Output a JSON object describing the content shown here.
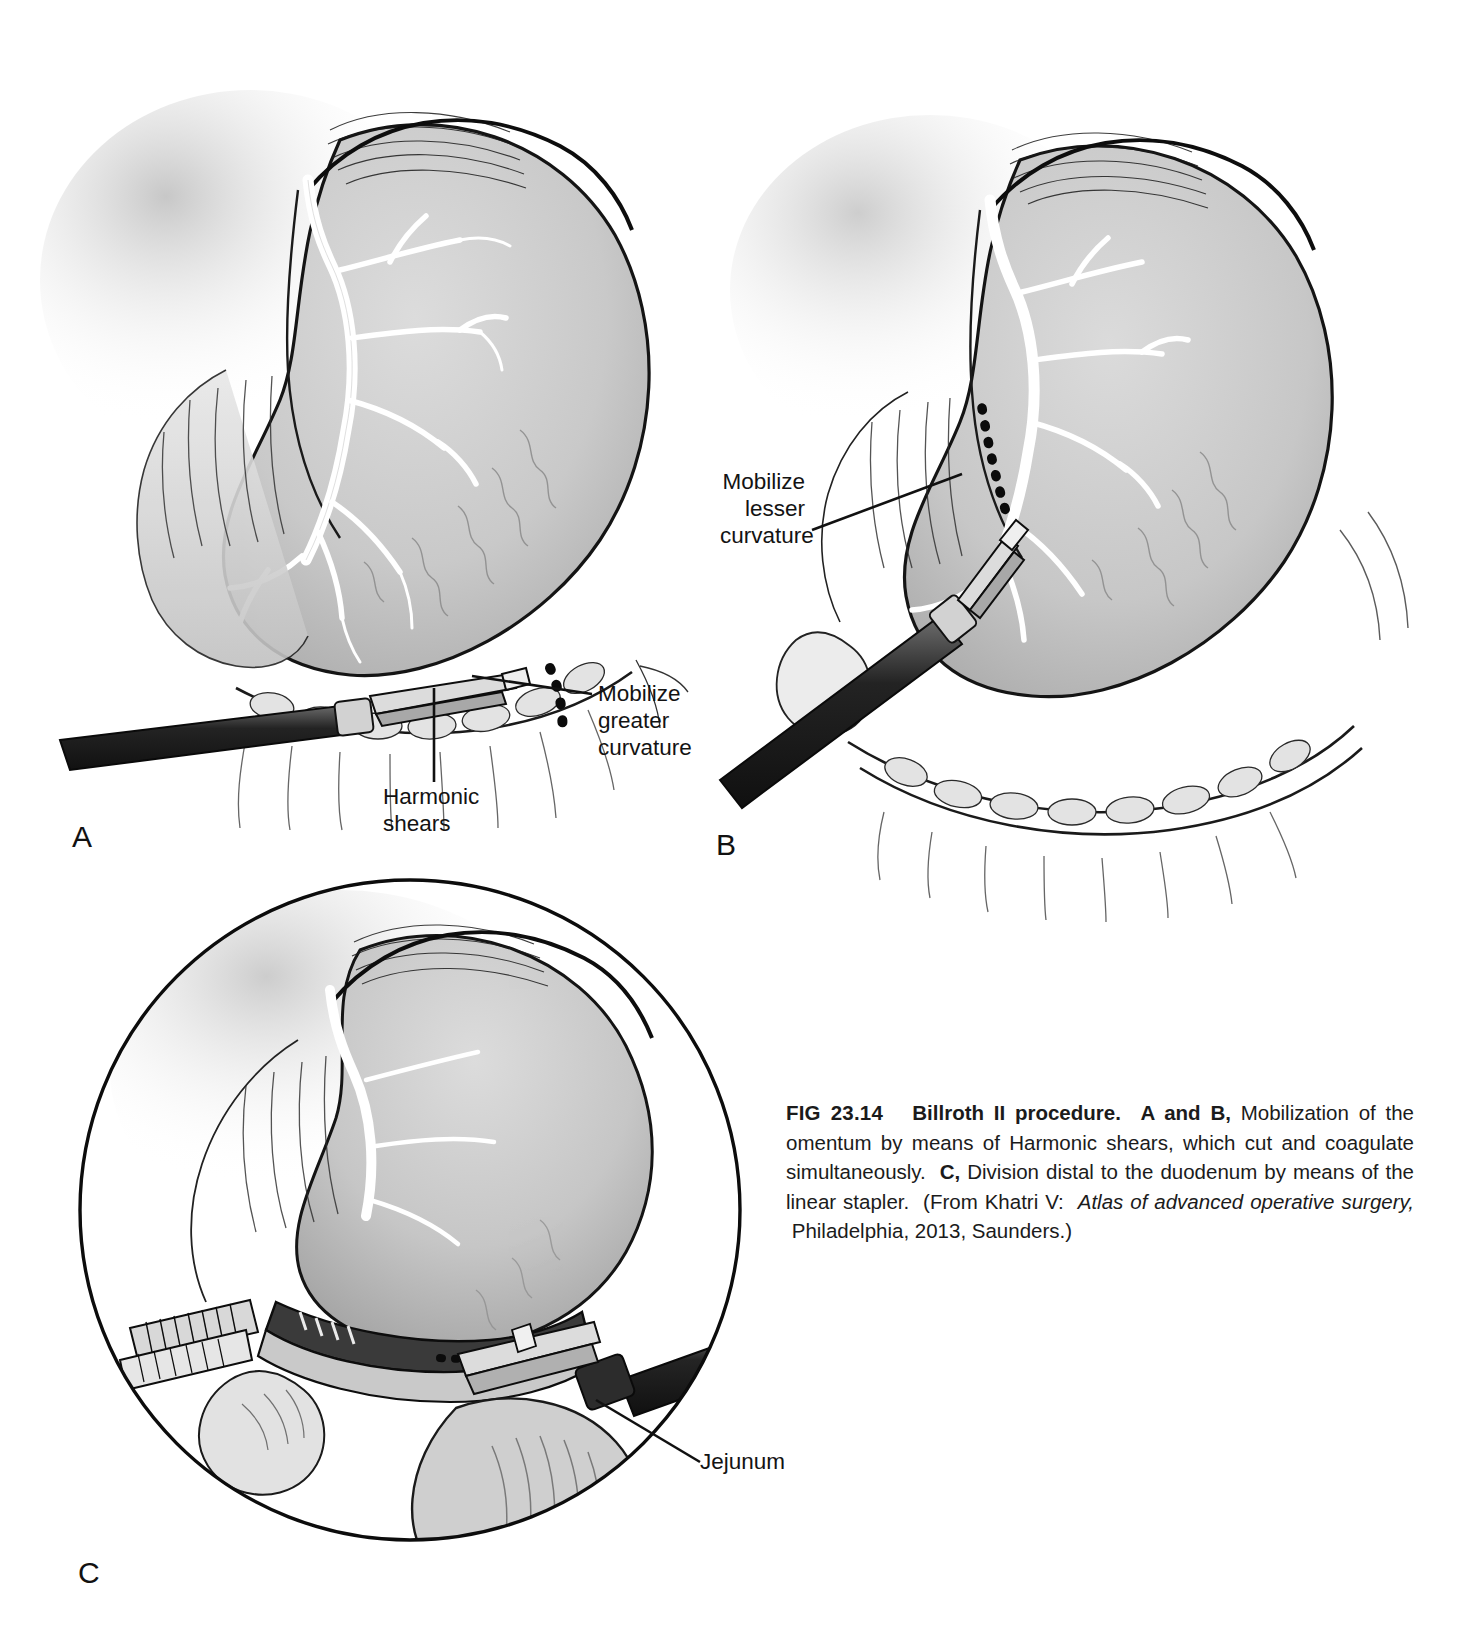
{
  "figure": {
    "panels": [
      {
        "letter": "A",
        "name": "panel-a"
      },
      {
        "letter": "B",
        "name": "panel-b"
      },
      {
        "letter": "C",
        "name": "panel-c"
      }
    ],
    "callouts": {
      "greater_curvature": "Mobilize\ngreater\ncurvature",
      "harmonic_shears": "Harmonic\nshears",
      "lesser_curvature": "Mobilize\nlesser\ncurvature",
      "jejunum": "Jejunum"
    },
    "caption": {
      "label": "FIG 23.14",
      "title": "Billroth II procedure.",
      "part_ab": "A and B,",
      "text_ab": "Mobilization of the omentum by means of Harmonic shears, which cut and coagulate simultaneously.",
      "part_c": "C,",
      "text_c": "Division distal to the duodenum by means of the linear stapler.",
      "source_prefix": "(From Khatri V:",
      "source_italic": "Atlas of advanced operative surgery,",
      "source_suffix": "Philadelphia, 2013, Saunders.)"
    }
  },
  "colors": {
    "ink": "#111111",
    "tissue_light": "#d9d9d9",
    "tissue_mid": "#bdbdbd",
    "tissue_dark": "#8f8f8f",
    "instrument_dark": "#2b2b2b",
    "vessel_white": "#ffffff",
    "background": "#ffffff"
  }
}
